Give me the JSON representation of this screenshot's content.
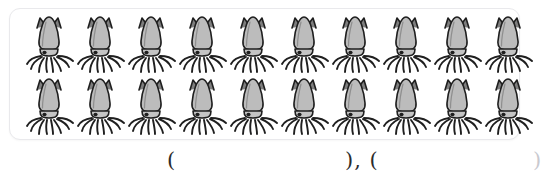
{
  "page": {
    "background_color": "#ffffff",
    "width": 544,
    "height": 180
  },
  "card": {
    "name": "squid-array-card",
    "border_color": "#e9e9ec",
    "background_color": "#ffffff",
    "corner_radius_px": 11
  },
  "array": {
    "icon_name": "squid-icon",
    "rows": 2,
    "columns": 10,
    "total_count": 20,
    "row_counts": [
      10,
      10
    ],
    "mantle_fill": "#b8b8b8",
    "mantle_highlight": "#d6d6d6",
    "outline_color": "#1f1f1f",
    "items": [
      {
        "row": 1,
        "count": 10,
        "cells": [
          "squid",
          "squid",
          "squid",
          "squid",
          "squid",
          "squid",
          "squid",
          "squid",
          "squid",
          "squid"
        ]
      },
      {
        "row": 2,
        "count": 10,
        "cells": [
          "squid",
          "squid",
          "squid",
          "squid",
          "squid",
          "squid",
          "squid",
          "squid",
          "squid",
          "squid"
        ]
      }
    ]
  },
  "answer": {
    "open_paren_1": "(",
    "blank_1_value": "",
    "mid_parens": "), (",
    "blank_2_value": "",
    "close_paren_2": ")",
    "full_text": "(        ), (        )",
    "text_color": "#2b2b2b"
  }
}
